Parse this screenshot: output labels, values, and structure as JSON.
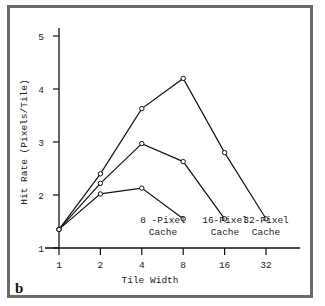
{
  "panel_label": "b",
  "chart_data": {
    "type": "line",
    "title": "",
    "xlabel": "Tile Width",
    "ylabel": "Hit Rate (Pixels/Tile)",
    "x_scale": "log2",
    "x": [
      1,
      2,
      4,
      8,
      16,
      32
    ],
    "x_tick_labels": [
      "1",
      "2",
      "4",
      "8",
      "16",
      "32"
    ],
    "y_ticks": [
      1,
      2,
      3,
      4,
      5
    ],
    "y_tick_labels": [
      "1",
      "2",
      "3",
      "4",
      "5"
    ],
    "ylim": [
      1,
      5
    ],
    "grid": false,
    "legend": "inline labels at series ends",
    "series": [
      {
        "name": "8-Pixel Cache",
        "label_line1": "8 -Pixel",
        "label_line2": "Cache",
        "x": [
          1,
          2,
          4,
          8
        ],
        "values": [
          1.35,
          2.02,
          2.13,
          1.55
        ]
      },
      {
        "name": "16-Pixel Cache",
        "label_line1": "16-Pixel",
        "label_line2": "Cache",
        "x": [
          1,
          2,
          4,
          8,
          16
        ],
        "values": [
          1.35,
          2.22,
          2.97,
          2.63,
          1.55
        ]
      },
      {
        "name": "32-Pixel Cache",
        "label_line1": "32-Pixel",
        "label_line2": "Cache",
        "x": [
          1,
          2,
          4,
          8,
          16,
          32
        ],
        "values": [
          1.35,
          2.4,
          3.63,
          4.2,
          2.8,
          1.55
        ]
      }
    ]
  }
}
